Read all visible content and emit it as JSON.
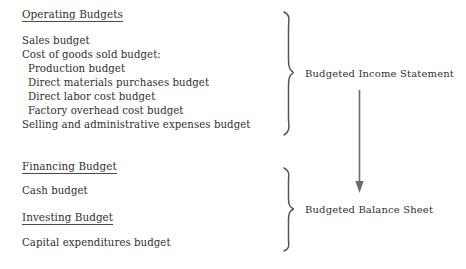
{
  "diagram": {
    "background_color": "#ffffff",
    "text_color": "#30302f",
    "stroke_color": "#545454"
  },
  "left_column": {
    "groups": [
      {
        "heading": "Operating Budgets",
        "items": [
          {
            "label": "Sales budget",
            "indent": 0
          },
          {
            "label": "Cost of goods sold budget:",
            "indent": 0
          },
          {
            "label": "Production budget",
            "indent": 1
          },
          {
            "label": "Direct materials purchases budget",
            "indent": 1
          },
          {
            "label": "Direct labor cost budget",
            "indent": 1
          },
          {
            "label": "Factory overhead cost budget",
            "indent": 1
          },
          {
            "label": "Selling and administrative expenses budget",
            "indent": 0
          }
        ]
      },
      {
        "heading": "Financing Budget",
        "items": [
          {
            "label": "Cash budget",
            "indent": 0
          }
        ]
      },
      {
        "heading": "Investing Budget",
        "items": [
          {
            "label": "Capital expenditures budget",
            "indent": 0
          }
        ]
      }
    ]
  },
  "right_column": {
    "outputs": [
      {
        "label": "Budgeted Income Statement"
      },
      {
        "label": "Budgeted Balance Sheet"
      }
    ]
  },
  "connectors": {
    "upper_brace": "curly-brace-upper",
    "lower_brace": "curly-brace-lower",
    "arrow": "down-arrow"
  }
}
